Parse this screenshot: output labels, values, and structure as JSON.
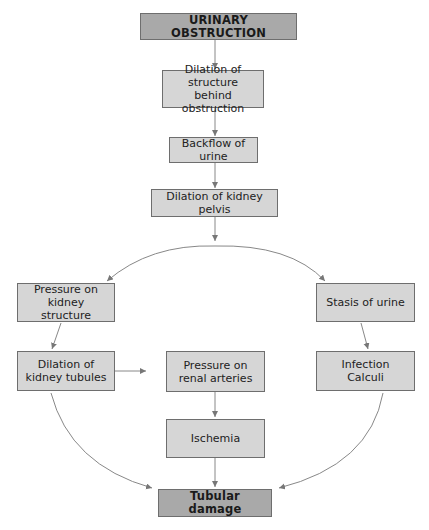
{
  "diagram": {
    "title_node": "URINARY OBSTRUCTION",
    "nodes": [
      {
        "id": "urinary-obstruction",
        "label": "URINARY OBSTRUCTION",
        "style": "dark"
      },
      {
        "id": "dilation-structure",
        "label": "Dilation of structure\nbehind obstruction",
        "style": "light"
      },
      {
        "id": "backflow-urine",
        "label": "Backflow of urine",
        "style": "light"
      },
      {
        "id": "dilation-pelvis",
        "label": "Dilation of kidney pelvis",
        "style": "light"
      },
      {
        "id": "pressure-structure",
        "label": "Pressure on\nkidney structure",
        "style": "light"
      },
      {
        "id": "stasis-urine",
        "label": "Stasis of urine",
        "style": "light"
      },
      {
        "id": "dilation-tubules",
        "label": "Dilation of\nkidney tubules",
        "style": "light"
      },
      {
        "id": "pressure-arteries",
        "label": "Pressure on\nrenal arteries",
        "style": "light"
      },
      {
        "id": "infection-calculi",
        "label": "Infection\nCalculi",
        "style": "light"
      },
      {
        "id": "ischemia",
        "label": "Ischemia",
        "style": "light"
      },
      {
        "id": "tubular-damage",
        "label": "Tubular damage",
        "style": "dark"
      }
    ],
    "edges": [
      {
        "from": "urinary-obstruction",
        "to": "dilation-structure"
      },
      {
        "from": "dilation-structure",
        "to": "backflow-urine"
      },
      {
        "from": "backflow-urine",
        "to": "dilation-pelvis"
      },
      {
        "from": "dilation-pelvis",
        "to": "pressure-structure"
      },
      {
        "from": "dilation-pelvis",
        "to": "stasis-urine"
      },
      {
        "from": "pressure-structure",
        "to": "dilation-tubules"
      },
      {
        "from": "stasis-urine",
        "to": "infection-calculi"
      },
      {
        "from": "dilation-tubules",
        "to": "pressure-arteries"
      },
      {
        "from": "pressure-arteries",
        "to": "ischemia"
      },
      {
        "from": "ischemia",
        "to": "tubular-damage"
      },
      {
        "from": "dilation-tubules",
        "to": "tubular-damage"
      },
      {
        "from": "infection-calculi",
        "to": "tubular-damage"
      }
    ],
    "colors": {
      "dark_box": "#a9a9a9",
      "light_box": "#d6d6d6",
      "border": "#6e6e6e",
      "arrow": "#777777",
      "text": "#222222"
    }
  }
}
